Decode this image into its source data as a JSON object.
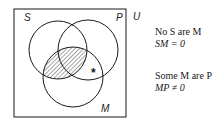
{
  "diagram": {
    "type": "venn-3-set",
    "universe_label": "U",
    "sets": [
      {
        "label": "S",
        "cx": 58,
        "cy": 50,
        "r": 29
      },
      {
        "label": "P",
        "cx": 88,
        "cy": 50,
        "r": 30
      },
      {
        "label": "M",
        "cx": 73,
        "cy": 77,
        "r": 30
      }
    ],
    "shaded_region": "S ∩ M",
    "marker": {
      "symbol": "*",
      "region": "M ∩ P outside S",
      "x": 95,
      "y": 73
    },
    "stroke_color": "#1a1a1a"
  },
  "statements": [
    {
      "line1": "No S are M",
      "line2": "SM = 0"
    },
    {
      "line1": "Some M are P",
      "line2": "MP ≠ 0"
    }
  ]
}
